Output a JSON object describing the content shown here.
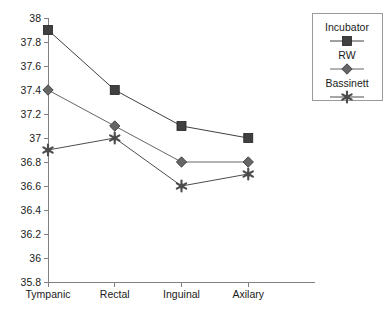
{
  "chart_data": {
    "type": "line",
    "title": "",
    "xlabel": "",
    "ylabel": "",
    "categories": [
      "Tympanic",
      "Rectal",
      "Inguinal",
      "Axilary"
    ],
    "series": [
      {
        "name": "Incubator",
        "marker": "square",
        "color": "#404040",
        "values": [
          37.9,
          37.4,
          37.1,
          37.0
        ]
      },
      {
        "name": "RW",
        "marker": "diamond",
        "color": "#666666",
        "values": [
          37.4,
          37.1,
          36.8,
          36.8
        ]
      },
      {
        "name": "Bassinett",
        "marker": "star",
        "color": "#4d4d4d",
        "values": [
          36.9,
          37.0,
          36.6,
          36.7
        ]
      }
    ],
    "ylim": [
      35.8,
      38.0
    ],
    "ytick_labels": [
      "38",
      "37.8",
      "37.6",
      "37.4",
      "37.2",
      "37",
      "36.8",
      "36.6",
      "36.4",
      "36.2",
      "36",
      "35.8"
    ],
    "ytick_values": [
      38,
      37.8,
      37.6,
      37.4,
      37.2,
      37,
      36.8,
      36.6,
      36.4,
      36.2,
      36,
      35.8
    ],
    "grid": false,
    "legend_position": "right-top",
    "legend_entries": [
      "Incubator",
      "RW",
      "Bassinett"
    ]
  },
  "axis": {
    "line_color": "#808080"
  }
}
